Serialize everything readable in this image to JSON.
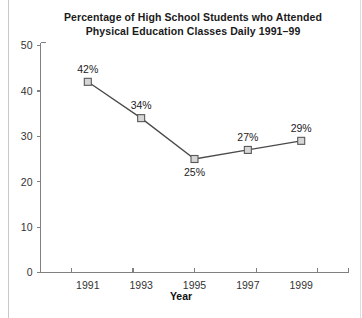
{
  "chart_data": {
    "type": "line",
    "title": "Percentage of High School Students who Attended Physical Education Classes Daily 1991–99",
    "title_lines": [
      "Percentage of High School Students who Attended",
      "Physical Education Classes Daily 1991–99"
    ],
    "xlabel": "Year",
    "ylabel": "",
    "categories": [
      "1991",
      "1993",
      "1995",
      "1997",
      "1999"
    ],
    "x": [
      1991,
      1993,
      1995,
      1997,
      1999
    ],
    "values": [
      42,
      34,
      25,
      27,
      29
    ],
    "point_labels": [
      "42%",
      "34%",
      "25%",
      "27%",
      "29%"
    ],
    "label_positions": [
      "above",
      "above",
      "below",
      "above",
      "above"
    ],
    "ylim": [
      0,
      50
    ],
    "xlim": [
      1990,
      2000
    ],
    "y_ticks": [
      "0",
      "10",
      "20",
      "30",
      "40",
      "50"
    ],
    "y_tick_values": [
      0,
      10,
      20,
      30,
      40,
      50
    ],
    "x_ticks": [
      "1991",
      "1993",
      "1995",
      "1997",
      "1999"
    ],
    "grid": false,
    "legend": false,
    "legend_position": "none",
    "marker": "square",
    "colors": {
      "line": "#4a4a4a",
      "marker_fill": "#d6d6d6",
      "marker_stroke": "#585858",
      "axis": "#808080",
      "text": "#222222",
      "background": "#ffffff"
    }
  }
}
